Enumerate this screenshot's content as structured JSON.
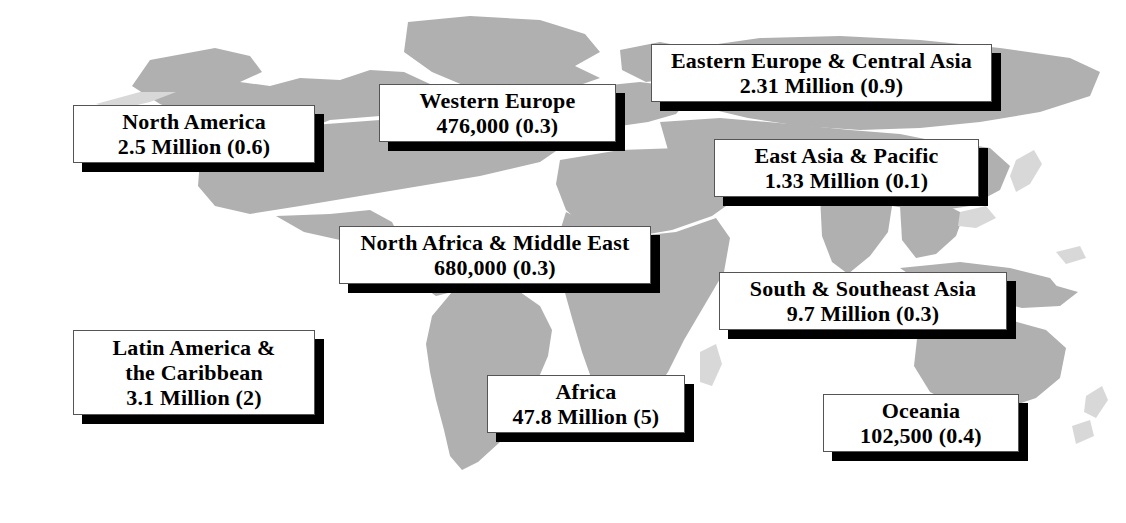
{
  "figure": {
    "type": "map-infographic",
    "land_color": "#b0b0b0",
    "background_color": "#ffffff",
    "box_fill": "#ffffff",
    "box_border": "#555555",
    "box_shadow_color": "#000000"
  },
  "regions": [
    {
      "name": "north-america",
      "lines": [
        "North America",
        "2.5 Million (0.6)"
      ],
      "value": "2.5 Million",
      "rate": "0.6",
      "box": {
        "x": 73,
        "y": 105,
        "w": 242,
        "h": 58,
        "font": 22
      }
    },
    {
      "name": "western-europe",
      "lines": [
        "Western Europe",
        "476,000 (0.3)"
      ],
      "value": "476,000",
      "rate": "0.3",
      "box": {
        "x": 379,
        "y": 84,
        "w": 237,
        "h": 58,
        "font": 22
      }
    },
    {
      "name": "eastern-europe-central-asia",
      "lines": [
        "Eastern Europe & Central Asia",
        "2.31 Million (0.9)"
      ],
      "value": "2.31 Million",
      "rate": "0.9",
      "box": {
        "x": 651,
        "y": 44,
        "w": 341,
        "h": 58,
        "font": 22
      }
    },
    {
      "name": "east-asia-pacific",
      "lines": [
        "East Asia & Pacific",
        "1.33 Million (0.1)"
      ],
      "value": "1.33 Million",
      "rate": "0.1",
      "box": {
        "x": 714,
        "y": 139,
        "w": 265,
        "h": 58,
        "font": 22
      }
    },
    {
      "name": "north-africa-middle-east",
      "lines": [
        "North Africa & Middle East",
        "680,000 (0.3)"
      ],
      "value": "680,000",
      "rate": "0.3",
      "box": {
        "x": 339,
        "y": 226,
        "w": 312,
        "h": 58,
        "font": 22
      }
    },
    {
      "name": "south-southeast-asia",
      "lines": [
        "South & Southeast Asia",
        "9.7 Million (0.3)"
      ],
      "value": "9.7 Million",
      "rate": "0.3",
      "box": {
        "x": 719,
        "y": 272,
        "w": 288,
        "h": 58,
        "font": 22
      }
    },
    {
      "name": "latin-america-caribbean",
      "lines": [
        "Latin America &",
        "the Caribbean",
        "3.1 Million (2)"
      ],
      "value": "3.1 Million",
      "rate": "2",
      "box": {
        "x": 73,
        "y": 330,
        "w": 242,
        "h": 85,
        "font": 22
      }
    },
    {
      "name": "africa",
      "lines": [
        "Africa",
        "47.8 Million (5)"
      ],
      "value": "47.8 Million",
      "rate": "5",
      "box": {
        "x": 487,
        "y": 375,
        "w": 198,
        "h": 58,
        "font": 22
      }
    },
    {
      "name": "oceania",
      "lines": [
        "Oceania",
        "102,500 (0.4)"
      ],
      "value": "102,500",
      "rate": "0.4",
      "box": {
        "x": 823,
        "y": 394,
        "w": 196,
        "h": 58,
        "font": 22
      }
    }
  ]
}
